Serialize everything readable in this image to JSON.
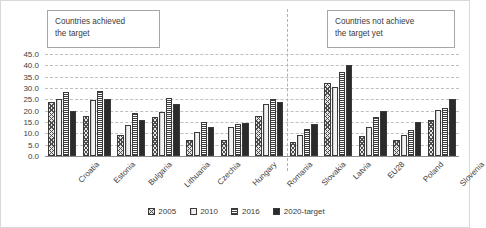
{
  "annotations": {
    "achieved": "Countries achieved\nthe target",
    "not_achieved": "Countries not achieve\nthe target yet"
  },
  "chart_data": {
    "type": "bar",
    "title": "",
    "subtitle": "",
    "xlabel": "",
    "ylabel": "",
    "ylim": [
      0.0,
      45.0
    ],
    "ytick_step": 5.0,
    "ytick_labels": [
      "45.0",
      "40.0",
      "35.0",
      "30.0",
      "25.0",
      "20.0",
      "15.0",
      "10.0",
      "5.0",
      "0.0"
    ],
    "grid": true,
    "legend_position": "bottom",
    "categories": [
      "Croatia",
      "Estonia",
      "Bulgaria",
      "Lithuania",
      "Czechia",
      "Hungary",
      "Romania",
      "Slovakia",
      "Latvia",
      "EU28",
      "Poland",
      "Slovenia"
    ],
    "series": [
      {
        "name": "2005",
        "fill": "diagonal-hatch",
        "values": [
          23.8,
          17.5,
          9.4,
          17.0,
          7.1,
          7.1,
          17.6,
          6.4,
          32.3,
          9.0,
          6.9,
          16.0
        ]
      },
      {
        "name": "2010",
        "fill": "light",
        "values": [
          25.1,
          24.6,
          13.9,
          19.6,
          10.5,
          12.7,
          22.8,
          9.1,
          30.4,
          12.9,
          9.3,
          20.4
        ]
      },
      {
        "name": "2016",
        "fill": "horizontal-stripes",
        "values": [
          28.3,
          28.8,
          18.8,
          25.6,
          14.9,
          14.2,
          25.0,
          12.0,
          37.2,
          17.0,
          11.3,
          21.3
        ]
      },
      {
        "name": "2020-target",
        "fill": "solid-dark",
        "values": [
          20.0,
          25.0,
          16.0,
          23.0,
          13.0,
          14.7,
          24.0,
          14.0,
          40.0,
          20.0,
          15.0,
          25.0
        ]
      }
    ],
    "divider_after_category": "Slovakia"
  },
  "legend": {
    "items": [
      {
        "label": "2005"
      },
      {
        "label": "2010"
      },
      {
        "label": "2016"
      },
      {
        "label": "2020-target"
      }
    ]
  },
  "colors": {
    "gridline": "#bfbfbf",
    "axis": "#8c8c8c",
    "text": "#404040",
    "target_bar": "#2b2b2b",
    "callout_border": "#a6a6a6"
  }
}
